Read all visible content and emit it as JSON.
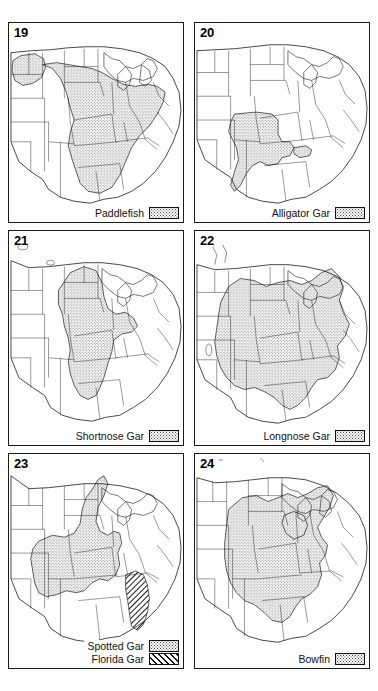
{
  "figure": {
    "background_color": "#ffffff",
    "line_color": "#1a1a1a",
    "stipple_color": "#4a4a4a"
  },
  "panels": [
    {
      "number": "19",
      "legend": [
        {
          "label": "Paddlefish",
          "pattern": "stipple"
        }
      ],
      "map": {
        "region": "central and eastern United States",
        "range_description": "Mississippi River basin from Montana and the Dakotas southeast through the Missouri and Ohio valleys to the Gulf Coast"
      }
    },
    {
      "number": "20",
      "legend": [
        {
          "label": "Alligator Gar",
          "pattern": "stipple"
        }
      ],
      "map": {
        "region": "central and eastern United States",
        "range_description": "lower Mississippi valley and Gulf Coast from Texas east to the Florida panhandle"
      }
    },
    {
      "number": "21",
      "legend": [
        {
          "label": "Shortnose Gar",
          "pattern": "stipple"
        }
      ],
      "map": {
        "region": "central and eastern United States",
        "range_description": "Mississippi and Missouri river basins from Montana south to Louisiana and east to Ohio"
      }
    },
    {
      "number": "22",
      "legend": [
        {
          "label": "Longnose Gar",
          "pattern": "stipple"
        }
      ],
      "map": {
        "region": "central and eastern United States",
        "range_description": "broadly across the central and eastern United States from the Great Plains to the Atlantic coast and Florida"
      }
    },
    {
      "number": "23",
      "legend": [
        {
          "label": "Spotted Gar",
          "pattern": "stipple"
        },
        {
          "label": "Florida Gar",
          "pattern": "hatch"
        }
      ],
      "map": {
        "region": "central and eastern United States",
        "range_description": "Spotted Gar across the lower Mississippi valley and Gulf states; Florida Gar restricted to peninsular Florida and southern Georgia"
      }
    },
    {
      "number": "24",
      "legend": [
        {
          "label": "Bowfin",
          "pattern": "stipple"
        }
      ],
      "map": {
        "region": "central and eastern United States",
        "range_description": "Mississippi valley, Great Lakes region and Atlantic and Gulf coastal plain south to Florida and Texas"
      }
    }
  ]
}
